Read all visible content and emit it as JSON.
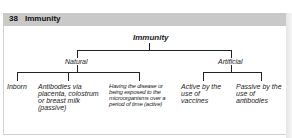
{
  "header": {
    "number": "38",
    "title": "Immunity"
  },
  "diagram": {
    "root": "Immunity",
    "branches": [
      {
        "label": "Natural",
        "children": [
          "Inborn",
          "Antibodies via placenta, colostrum or breast milk (passive)",
          "Having the disease or being exposed to the microorganisms over a period of time (active)"
        ]
      },
      {
        "label": "Artificial",
        "children": [
          "Active by the use of vaccines",
          "Passive by the use of antibodies"
        ]
      }
    ]
  }
}
